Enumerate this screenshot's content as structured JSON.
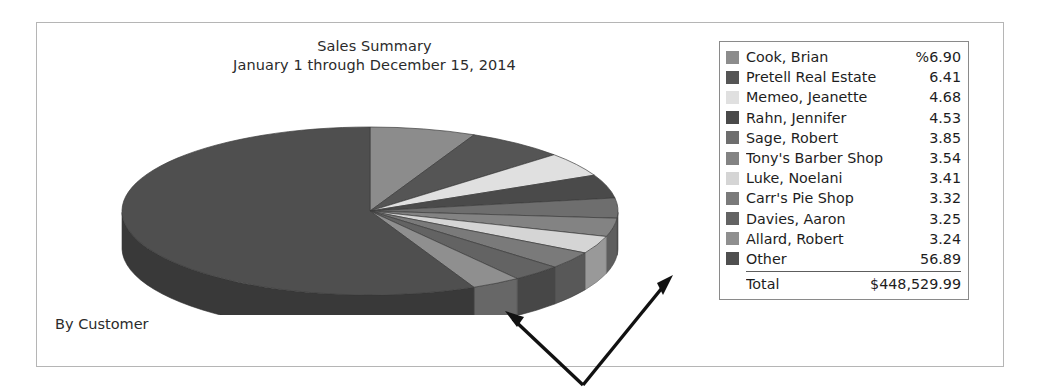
{
  "report": {
    "title_line1": "Sales Summary",
    "title_line2": "January 1 through December 15, 2014",
    "footer_label": "By Customer"
  },
  "legend": {
    "total_label": "Total",
    "total_value": "$448,529.99",
    "rows": [
      {
        "label": "Cook, Brian",
        "value": "%6.90",
        "percent": 6.9,
        "color": "#8c8c8c"
      },
      {
        "label": "Pretell Real Estate",
        "value": "6.41",
        "percent": 6.41,
        "color": "#555555"
      },
      {
        "label": "Memeo, Jeanette",
        "value": "4.68",
        "percent": 4.68,
        "color": "#e0e0e0"
      },
      {
        "label": "Rahn, Jennifer",
        "value": "4.53",
        "percent": 4.53,
        "color": "#4a4a4a"
      },
      {
        "label": "Sage, Robert",
        "value": "3.85",
        "percent": 3.85,
        "color": "#6e6e6e"
      },
      {
        "label": "Tony's Barber Shop",
        "value": "3.54",
        "percent": 3.54,
        "color": "#838383"
      },
      {
        "label": "Luke, Noelani",
        "value": "3.41",
        "percent": 3.41,
        "color": "#d5d5d5"
      },
      {
        "label": "Carr's Pie Shop",
        "value": "3.32",
        "percent": 3.32,
        "color": "#7a7a7a"
      },
      {
        "label": "Davies, Aaron",
        "value": "3.25",
        "percent": 3.25,
        "color": "#636363"
      },
      {
        "label": "Allard, Robert",
        "value": "3.24",
        "percent": 3.24,
        "color": "#8f8f8f"
      },
      {
        "label": "Other",
        "value": "56.89",
        "percent": 56.89,
        "color": "#4f4f4f"
      }
    ]
  },
  "chart_data": {
    "type": "pie",
    "title": "Sales Summary",
    "subtitle": "January 1 through December 15, 2014",
    "grouping": "By Customer",
    "units": "percent",
    "total": 448529.99,
    "total_formatted": "$448,529.99",
    "three_d": true,
    "start_angle_deg": -90,
    "direction": "clockwise",
    "legend_position": "right",
    "categories": [
      "Cook, Brian",
      "Pretell Real Estate",
      "Memeo, Jeanette",
      "Rahn, Jennifer",
      "Sage, Robert",
      "Tony's Barber Shop",
      "Luke, Noelani",
      "Carr's Pie Shop",
      "Davies, Aaron",
      "Allard, Robert",
      "Other"
    ],
    "values": [
      6.9,
      6.41,
      4.68,
      4.53,
      3.85,
      3.54,
      3.41,
      3.32,
      3.25,
      3.24,
      56.89
    ],
    "colors": [
      "#8c8c8c",
      "#555555",
      "#e0e0e0",
      "#4a4a4a",
      "#6e6e6e",
      "#838383",
      "#d5d5d5",
      "#7a7a7a",
      "#636363",
      "#8f8f8f",
      "#4f4f4f"
    ]
  },
  "annotations": {
    "arrow_left": "arrow pointing to pie 3d edge",
    "arrow_right": "arrow pointing up-right away from pie"
  }
}
